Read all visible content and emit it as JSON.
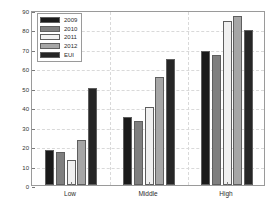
{
  "chart_data": {
    "type": "bar",
    "title": "",
    "subtitle": "",
    "xlabel": "",
    "ylabel": "Energy Consumption unit area",
    "categories": [
      "Low",
      "Middle",
      "High"
    ],
    "series": [
      {
        "name": "2009",
        "color": "#1a1a1a",
        "values": [
          18,
          35,
          69
        ]
      },
      {
        "name": "2010",
        "color": "#7f7f7f",
        "values": [
          17,
          33,
          67
        ]
      },
      {
        "name": "2011",
        "color": "#f0f0f0",
        "values": [
          13,
          40,
          84.5
        ]
      },
      {
        "name": "2012",
        "color": "#a6a6a6",
        "values": [
          23,
          55.5,
          87
        ]
      },
      {
        "name": "EUI",
        "color": "#262626",
        "values": [
          50,
          65,
          79.5
        ]
      }
    ],
    "ylim": [
      0,
      90
    ],
    "yticks": [
      0,
      10,
      20,
      30,
      40,
      50,
      60,
      70,
      80,
      90
    ],
    "ytick_labels": [
      "0",
      "10",
      "20",
      "30",
      "40",
      "50",
      "60",
      "70",
      "80",
      "90"
    ],
    "grid": true,
    "grid_style": "dashed",
    "grid_color": "#d9d9d9",
    "legend_position": "upper left",
    "axis_color": "#9a9a9a",
    "background": "#ffffff"
  }
}
